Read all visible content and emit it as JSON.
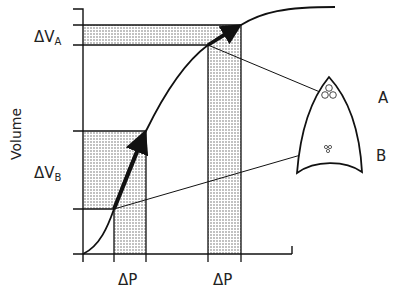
{
  "figure": {
    "y_axis_label": "Volume",
    "labels": {
      "delta_v_a": "ΔV",
      "delta_v_a_sub": "A",
      "delta_v_b": "ΔV",
      "delta_v_b_sub": "B",
      "delta_p_left": "ΔP",
      "delta_p_right": "ΔP",
      "region_a": "A",
      "region_b": "B"
    }
  },
  "colors": {
    "line": "#111111",
    "stipple": "#555555",
    "background": "#ffffff"
  }
}
